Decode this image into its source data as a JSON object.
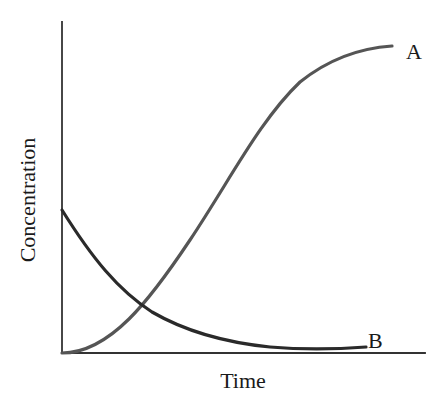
{
  "figure": {
    "width": 445,
    "height": 401,
    "background_color": "#ffffff",
    "cropped_top_text": "· · · · · · · · · · · · · · · ·"
  },
  "labels": {
    "ylabel": "Concentration",
    "xlabel": "Time",
    "series_a": "A",
    "series_b": "B"
  },
  "colors": {
    "axis": "#333333",
    "series_a": "#555555",
    "series_b": "#2a2a2a",
    "text": "#1a1a1a"
  },
  "chart_data": {
    "type": "line",
    "title": "",
    "subtitle": "",
    "xlabel": "Time",
    "ylabel": "Concentration",
    "xlim": [
      0,
      1
    ],
    "ylim": [
      0,
      1
    ],
    "grid": false,
    "axis_ticks": false,
    "tick_labels": {
      "x": [],
      "y": []
    },
    "legend": {
      "position": "inline-end-of-curve",
      "entries": [
        "A",
        "B"
      ]
    },
    "annotations": [
      {
        "text": "A",
        "x": 0.91,
        "y": 0.93,
        "note": "label at plateau end of rising curve"
      },
      {
        "text": "B",
        "x": 0.86,
        "y": 0.05,
        "note": "label at asymptotic tail of decaying curve"
      },
      {
        "text": "crossing point",
        "x": 0.155,
        "y": 0.287,
        "note": "curves A and B intersect"
      }
    ],
    "x": [
      0.0,
      0.05,
      0.1,
      0.15,
      0.2,
      0.25,
      0.3,
      0.35,
      0.4,
      0.45,
      0.5,
      0.55,
      0.6,
      0.65,
      0.7,
      0.75,
      0.8,
      0.85,
      0.9
    ],
    "series": [
      {
        "name": "A",
        "color": "#555555",
        "shape": "saturating-rise (product formation)",
        "start_value": 0.0,
        "end_value": 0.92,
        "values": [
          0.0,
          0.1,
          0.195,
          0.285,
          0.37,
          0.45,
          0.525,
          0.595,
          0.66,
          0.715,
          0.765,
          0.81,
          0.847,
          0.876,
          0.898,
          0.911,
          0.918,
          0.921,
          0.922
        ]
      },
      {
        "name": "B",
        "color": "#2a2a2a",
        "shape": "exponential decay (reactant consumption)",
        "start_value": 0.432,
        "end_value": 0.025,
        "values": [
          0.432,
          0.375,
          0.325,
          0.281,
          0.243,
          0.21,
          0.181,
          0.156,
          0.134,
          0.115,
          0.098,
          0.084,
          0.071,
          0.061,
          0.052,
          0.044,
          0.037,
          0.031,
          0.026
        ]
      }
    ]
  },
  "geometry": {
    "origin_px": {
      "x": 62,
      "y": 353
    },
    "y_axis_top_px": 22,
    "x_axis_right_px": 425,
    "stroke_width_curve": 3.2,
    "stroke_width_axis": 1.8
  }
}
